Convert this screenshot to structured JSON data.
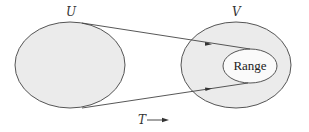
{
  "diagram": {
    "domain_label": "U",
    "codomain_label": "V",
    "range_label": "Range",
    "transform_label": "T",
    "colors": {
      "fill": "#ebebeb",
      "stroke": "#555555",
      "inner_fill": "#fafafa",
      "background": "#ffffff"
    }
  }
}
